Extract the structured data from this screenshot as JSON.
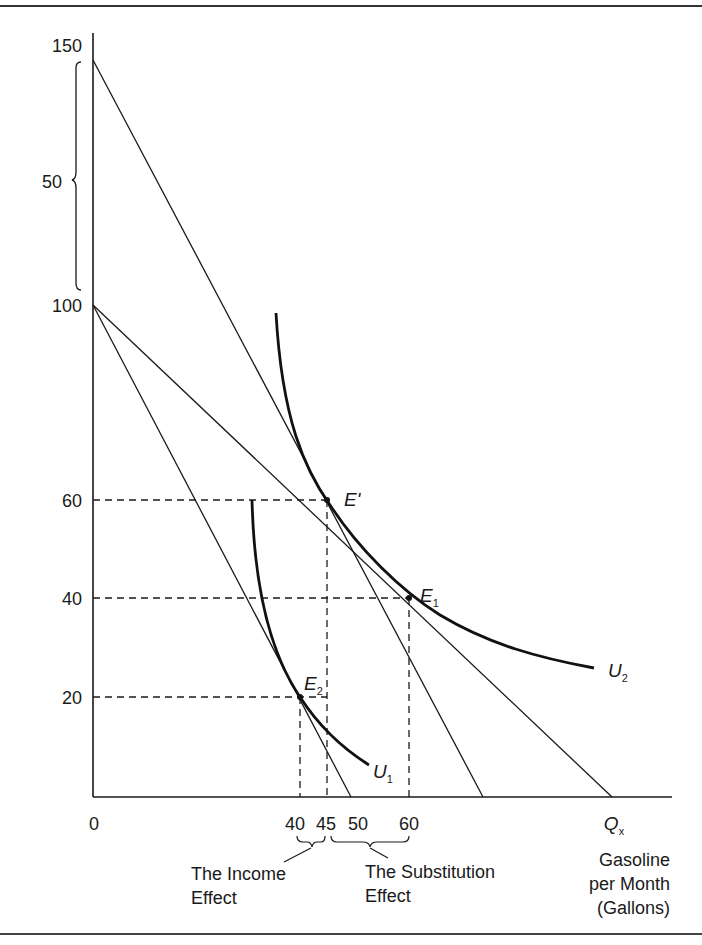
{
  "figure": {
    "y_axis": {
      "ticks": [
        {
          "value": "150",
          "y": 45
        },
        {
          "value": "100",
          "y": 305
        },
        {
          "value": "60",
          "y": 500
        },
        {
          "value": "40",
          "y": 598
        },
        {
          "value": "20",
          "y": 697
        }
      ],
      "bracket_label": "50"
    },
    "x_axis": {
      "origin_label": "0",
      "ticks": [
        {
          "value": "40",
          "x": 300
        },
        {
          "value": "45",
          "x": 327
        },
        {
          "value": "50",
          "x": 351
        },
        {
          "value": "60",
          "x": 409
        }
      ],
      "variable_label": "Q",
      "variable_sub": "x",
      "title_lines": [
        "Gasoline",
        "per Month",
        "(Gallons)"
      ]
    },
    "points": {
      "e_prime": {
        "label": "E'",
        "x_value": 45,
        "y_value": 60
      },
      "e1": {
        "label": "E",
        "sub": "1",
        "x_value": 60,
        "y_value": 40
      },
      "e2": {
        "label": "E",
        "sub": "2",
        "x_value": 40,
        "y_value": 20
      }
    },
    "curves": {
      "u1": {
        "label": "U",
        "sub": "1"
      },
      "u2": {
        "label": "U",
        "sub": "2"
      }
    },
    "annotations": {
      "income_effect": [
        "The Income",
        "Effect"
      ],
      "substitution_effect": [
        "The Substitution",
        "Effect"
      ]
    },
    "budget_lines": [
      {
        "name": "compensated budget line",
        "y_intercept": 150
      },
      {
        "name": "original budget line",
        "y_intercept": 100
      },
      {
        "name": "new budget line after price rise",
        "y_intercept": 100
      }
    ]
  }
}
